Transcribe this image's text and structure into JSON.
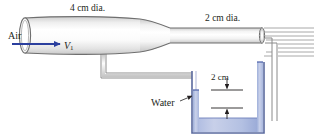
{
  "figure": {
    "type": "engineering-schematic",
    "width": 314,
    "height": 139,
    "background": "#ffffff"
  },
  "labels": {
    "inlet_diameter": "4 cm dia.",
    "outlet_diameter": "2 cm dia.",
    "fluid_inlet": "Air",
    "velocity_symbol": "V",
    "velocity_subscript": "1",
    "manometer_height": "2 cm",
    "manometer_fluid": "Water"
  },
  "colors": {
    "arrow_blue": "#2b3f9e",
    "water_fill_light": "#c6cfe8",
    "water_fill_dark": "#8e9fd0",
    "water_edge": "#4a5fa8",
    "pipe_outline": "#6f6f6f",
    "pipe_fill_light": "#ffffff",
    "pipe_fill_shade": "#dcdcdc",
    "hatch_line": "#9a9a9a",
    "text": "#231f20",
    "leader_line": "#3a3a3a"
  },
  "elements": {
    "inlet_pipe": "4 cm diameter horizontal cylindrical duct",
    "nozzle": "converging contraction section",
    "outlet_pipe": "2 cm diameter horizontal cylindrical duct",
    "wall": "hatched wall at right discharge",
    "pressure_tap_tube": "tube from duct down to manometer tank",
    "tank": "open water reservoir",
    "dimension_2cm": "vertical dimension between water levels"
  }
}
